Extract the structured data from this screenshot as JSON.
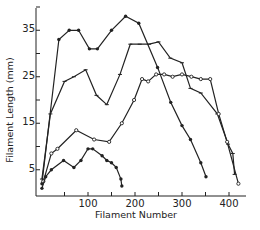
{
  "chart_data": {
    "type": "line",
    "title": "",
    "xlabel": "Filament Number",
    "ylabel": "Filament Length (mm)",
    "xlim": [
      -10,
      440
    ],
    "ylim": [
      0,
      40
    ],
    "xticks": [
      50,
      100,
      150,
      200,
      250,
      300,
      350,
      400
    ],
    "xtick_labels": [
      "",
      "100",
      "",
      "200",
      "",
      "300",
      "",
      "400"
    ],
    "yticks": [
      5,
      10,
      15,
      20,
      25,
      30,
      35,
      40
    ],
    "ytick_labels": [
      "5",
      "",
      "15",
      "",
      "25",
      "",
      "35",
      ""
    ],
    "grid": false,
    "legend": null,
    "series": [
      {
        "name": "Series 1 (filled markers, tallest early peak)",
        "marker": "filled-circle",
        "x": [
          2,
          38,
          60,
          80,
          103,
          120,
          150,
          180,
          208,
          248,
          276,
          300,
          318,
          340,
          351
        ],
        "y": [
          2,
          33,
          35,
          35,
          31,
          31,
          35,
          38,
          36.5,
          27,
          19.5,
          14.5,
          11.5,
          6.5,
          3.5
        ]
      },
      {
        "name": "Series 2 (bar markers)",
        "marker": "tick",
        "x": [
          2,
          20,
          50,
          70,
          95,
          118,
          140,
          168,
          190,
          210,
          230,
          250,
          275,
          300,
          318,
          340,
          375,
          398,
          408,
          412
        ],
        "y": [
          3,
          17,
          24,
          25,
          26.5,
          21,
          19,
          25.5,
          32,
          32,
          32,
          32.5,
          29,
          28,
          22.5,
          21.5,
          17,
          10.5,
          8.5,
          4
        ]
      },
      {
        "name": "Series 3 (open circle markers)",
        "marker": "open-circle",
        "x": [
          5,
          22,
          35,
          75,
          113,
          145,
          172,
          198,
          215,
          228,
          245,
          262,
          280,
          300,
          320,
          340,
          360,
          378,
          396,
          420
        ],
        "y": [
          2.5,
          8.5,
          9.5,
          13.5,
          11.5,
          11,
          15,
          20,
          24.5,
          24,
          25.5,
          25.5,
          25,
          25.5,
          25,
          24.5,
          24.5,
          17,
          11,
          2
        ]
      },
      {
        "name": "Series 4 (filled small markers, lowest)",
        "marker": "filled-circle",
        "x": [
          2,
          10,
          22,
          48,
          70,
          85,
          100,
          110,
          130,
          140,
          150,
          160,
          170,
          172
        ],
        "y": [
          1,
          3.5,
          5,
          7,
          5.5,
          7,
          9.5,
          9.5,
          8,
          7,
          6.5,
          5.5,
          3,
          1.5
        ]
      }
    ]
  }
}
